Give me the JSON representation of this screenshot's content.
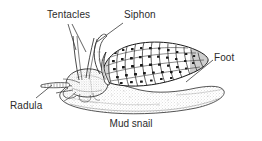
{
  "figure": {
    "caption": "Mud snail",
    "style": "black and white stippled scientific illustration",
    "colors": {
      "background": "#ffffff",
      "ink": "#1a1a1a",
      "text": "#2b2b2b",
      "leader_line": "#3a3a3a",
      "stipple": "#8a8a8a"
    }
  },
  "labels": {
    "tentacles": "Tentacles",
    "siphon": "Siphon",
    "foot": "Foot",
    "radula": "Radula"
  },
  "parts": [
    {
      "name": "tentacles",
      "label": "Tentacles",
      "description": "two long slender tentacles rising from the head"
    },
    {
      "name": "siphon",
      "label": "Siphon",
      "description": "thin curved tube rising in front of the shell"
    },
    {
      "name": "shell",
      "label": "Shell",
      "description": "elongated ribbed and speckled spiral shell"
    },
    {
      "name": "foot",
      "label": "Foot",
      "description": "broad flat stippled muscular foot"
    },
    {
      "name": "radula",
      "label": "Radula",
      "description": "banded feeding ribbon extending from the mouth"
    }
  ],
  "leader_lines": [
    {
      "from": "Tentacles",
      "to": "tentacle bases"
    },
    {
      "from": "Siphon",
      "to": "siphon tube"
    },
    {
      "from": "Foot",
      "to": "rear of foot"
    },
    {
      "from": "Radula",
      "to": "radula tube"
    }
  ]
}
